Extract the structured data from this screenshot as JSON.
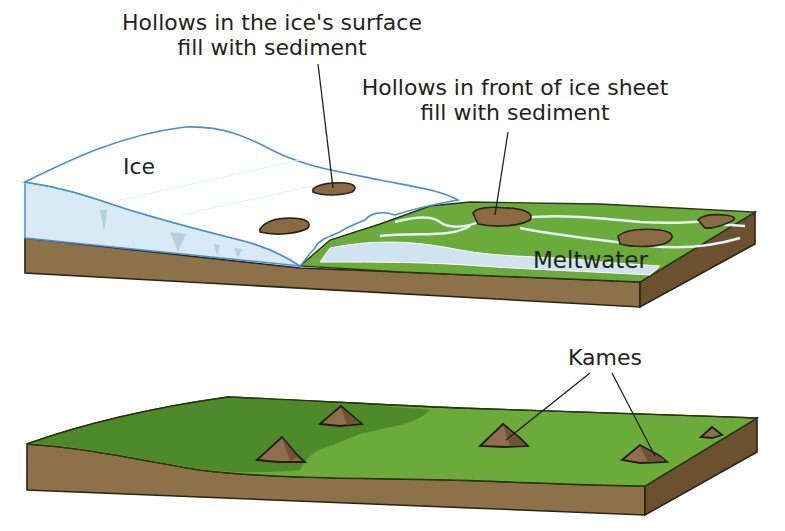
{
  "diagram": {
    "panels": [
      {
        "id": "before",
        "description": "Ice sheet melting over a landscape; hollows fill with sediment",
        "labels": {
          "hollows_ice_line1": "Hollows in the ice's surface",
          "hollows_ice_line2": "fill with sediment",
          "hollows_front_line1": "Hollows in front of ice sheet",
          "hollows_front_line2": "fill with sediment",
          "ice": "Ice",
          "meltwater": "Meltwater"
        }
      },
      {
        "id": "after",
        "description": "Ice has melted leaving mounds of sediment (kames) on the landscape",
        "labels": {
          "kames": "Kames"
        }
      }
    ],
    "colors": {
      "ice": "#ffffff",
      "ice_outline": "#4a8fd0",
      "ice_front": "#d7eaf6",
      "grass": "#6aab3a",
      "grass_dark": "#4e8a2a",
      "soil": "#8d7148",
      "soil_side": "#6b5130",
      "sediment": "#8a6a43",
      "meltwater": "#cfe3f0",
      "text": "#231f20"
    }
  }
}
